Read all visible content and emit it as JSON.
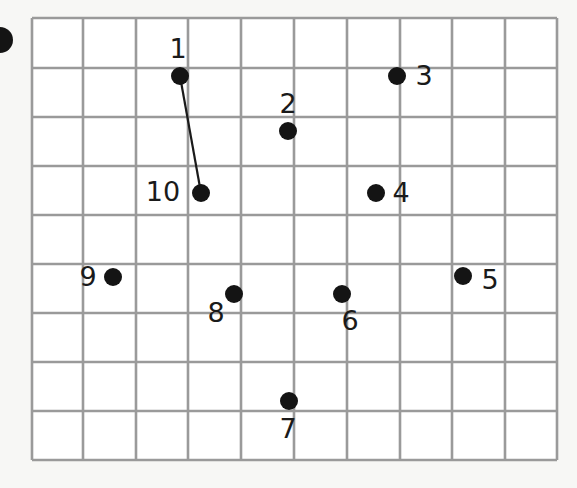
{
  "puzzle": {
    "type": "connect-the-dots",
    "grid": {
      "columns": 10,
      "rows": 9,
      "x_lines": [
        32,
        83,
        136,
        188,
        241,
        294,
        347,
        400,
        452,
        505,
        557
      ],
      "y_lines": [
        18,
        68,
        117,
        166,
        215,
        264,
        313,
        362,
        411,
        460
      ],
      "line_color": "#9a9a9a",
      "background": "#ffffff"
    },
    "dot_color": "#141414",
    "dot_radius": 9,
    "dots": [
      {
        "label": "1",
        "x": 180,
        "y": 76,
        "lx": 178,
        "ly": 58
      },
      {
        "label": "2",
        "x": 288,
        "y": 131,
        "lx": 288,
        "ly": 113
      },
      {
        "label": "3",
        "x": 397,
        "y": 76,
        "lx": 424,
        "ly": 85
      },
      {
        "label": "4",
        "x": 376,
        "y": 193,
        "lx": 401,
        "ly": 202
      },
      {
        "label": "5",
        "x": 463,
        "y": 276,
        "lx": 490,
        "ly": 289
      },
      {
        "label": "6",
        "x": 342,
        "y": 294,
        "lx": 350,
        "ly": 330
      },
      {
        "label": "7",
        "x": 289,
        "y": 401,
        "lx": 288,
        "ly": 438
      },
      {
        "label": "8",
        "x": 234,
        "y": 294,
        "lx": 216,
        "ly": 322
      },
      {
        "label": "9",
        "x": 113,
        "y": 277,
        "lx": 88,
        "ly": 286
      },
      {
        "label": "10",
        "x": 201,
        "y": 193,
        "lx": 163,
        "ly": 201
      }
    ],
    "connections": [
      {
        "from": "1",
        "to": "10"
      }
    ]
  }
}
